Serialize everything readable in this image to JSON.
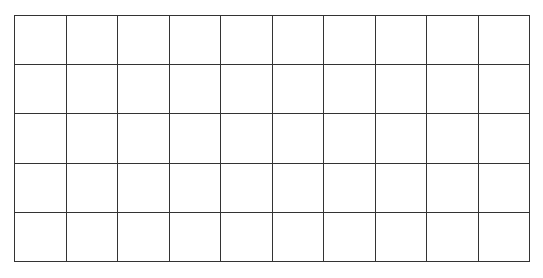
{
  "grid": {
    "rows": 5,
    "columns": 10,
    "line_color": "#333333",
    "background": "#ffffff",
    "cells": []
  }
}
